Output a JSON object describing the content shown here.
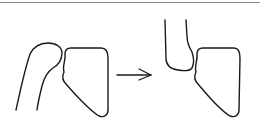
{
  "diagram": {
    "type": "line-drawing",
    "stroke_color": "#1a1a1a",
    "rule_color": "#8a8a8a",
    "panels": [
      {
        "name": "before",
        "parts": [
          "curved-shaft",
          "block"
        ]
      },
      {
        "name": "after",
        "parts": [
          "u-shaped-end",
          "block"
        ]
      }
    ],
    "connector": {
      "type": "arrow",
      "direction": "right"
    }
  }
}
